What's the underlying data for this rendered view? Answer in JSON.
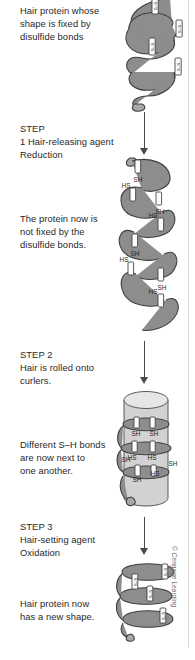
{
  "figure": {
    "title_alt": "Permanent wave chemistry of hair protein",
    "copyright": "© Cengage Learning",
    "accent_color": "#8d8d8d",
    "text_color": "#28282a",
    "rule_color": "#d7d7d7"
  },
  "captions": {
    "stage1": "Hair protein whose\nshape is fixed by\ndisulfide bonds",
    "step1": "STEP\n1 Hair-releasing agent\nReduction",
    "stage2": "The protein now is\nnot fixed by the\ndisulfide bonds.",
    "step2": "STEP 2\nHair is rolled onto\ncurlers.",
    "stage3": "Different S–H bonds\nare now next to\none another.",
    "step3": "STEP 3\nHair-setting agent\nOxidation",
    "stage4": "Hair protein now\nhas a new shape."
  },
  "labels": {
    "disulfide": "S–S",
    "thiol_right": "SH",
    "thiol_left": "HS"
  },
  "diagram": {
    "stage1_bonds": 4,
    "stage2_thiol_pairs": 4,
    "stage3_thiol_pairs": 3,
    "stage4_bonds": 3,
    "arrows": 3
  }
}
